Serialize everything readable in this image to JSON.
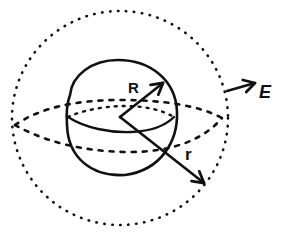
{
  "diagram": {
    "type": "physics-gauss-sphere",
    "stroke_color": "#111111",
    "background": "#ffffff",
    "labels": {
      "inner_radius": "R",
      "gaussian_radius": "r",
      "field": "E"
    },
    "elements": [
      {
        "name": "charged-sphere",
        "style": "solid",
        "description": "inner solid sphere of radius R"
      },
      {
        "name": "gaussian-surface",
        "style": "dotted",
        "description": "outer dotted spherical surface of radius r"
      },
      {
        "name": "radius-R-arrow",
        "label": "R"
      },
      {
        "name": "radius-r-arrow",
        "label": "r"
      },
      {
        "name": "field-E-arrow",
        "label": "E"
      }
    ]
  }
}
